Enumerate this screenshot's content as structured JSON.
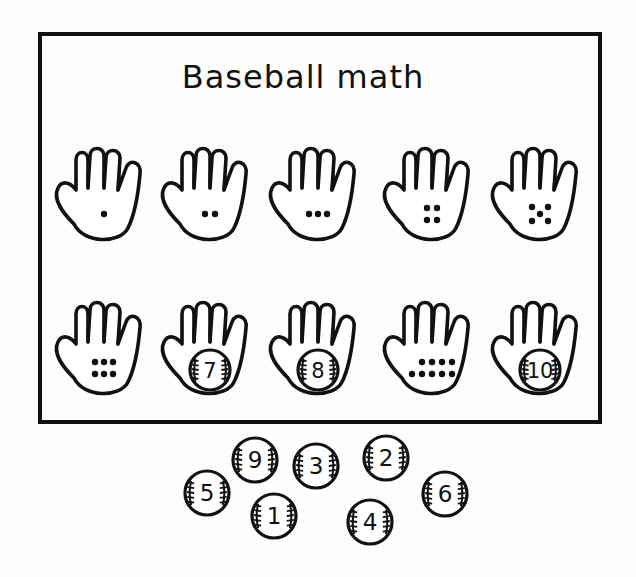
{
  "worksheet": {
    "title": "Baseball math",
    "row1": [
      {
        "count": 1,
        "kind": "dots"
      },
      {
        "count": 2,
        "kind": "dots"
      },
      {
        "count": 3,
        "kind": "dots"
      },
      {
        "count": 4,
        "kind": "dots"
      },
      {
        "count": 5,
        "kind": "dots"
      }
    ],
    "row2": [
      {
        "count": 6,
        "kind": "dots"
      },
      {
        "count": 7,
        "kind": "ball",
        "label": "7"
      },
      {
        "count": 8,
        "kind": "ball",
        "label": "8"
      },
      {
        "count": 9,
        "kind": "dots"
      },
      {
        "count": 10,
        "kind": "ball",
        "label": "10"
      }
    ],
    "loose_balls": [
      {
        "label": "9",
        "x": 255,
        "y": 460
      },
      {
        "label": "3",
        "x": 316,
        "y": 466
      },
      {
        "label": "2",
        "x": 386,
        "y": 458
      },
      {
        "label": "5",
        "x": 207,
        "y": 493
      },
      {
        "label": "1",
        "x": 274,
        "y": 516
      },
      {
        "label": "4",
        "x": 370,
        "y": 522
      },
      {
        "label": "6",
        "x": 445,
        "y": 494
      }
    ],
    "colors": {
      "ink": "#111111",
      "paper": "#fdfdfc"
    }
  }
}
